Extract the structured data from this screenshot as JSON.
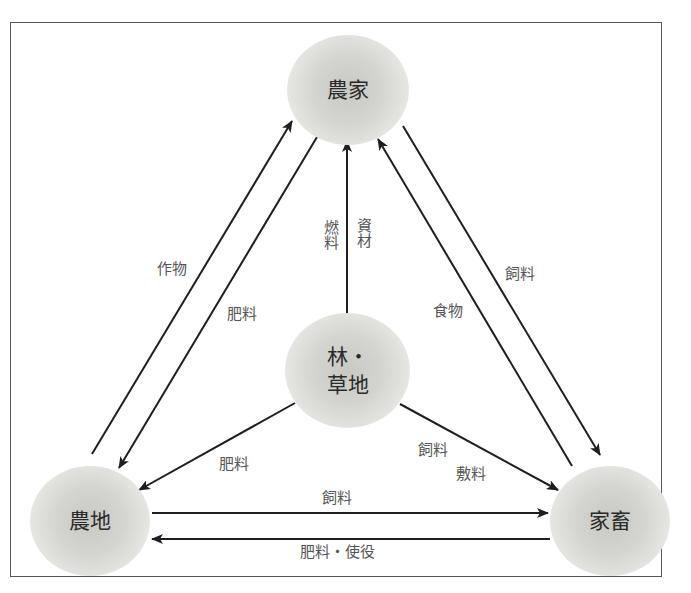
{
  "diagram": {
    "title": "",
    "nodes": {
      "farmhouse": {
        "label": "農家"
      },
      "forest": {
        "line1": "林・",
        "line2": "草地"
      },
      "farmland": {
        "label": "農地"
      },
      "livestock": {
        "label": "家畜"
      }
    },
    "edges": {
      "farmland_to_farmhouse": {
        "from": "農地",
        "to": "農家",
        "label": "作物"
      },
      "farmhouse_to_farmland": {
        "from": "農家",
        "to": "農地",
        "label": "肥料"
      },
      "forest_to_farmhouse": {
        "from": "林・草地",
        "to": "農家",
        "label_left": "燃料",
        "label_right": "資材"
      },
      "farmhouse_to_livestock": {
        "from": "農家",
        "to": "家畜",
        "label": "飼料"
      },
      "livestock_to_farmhouse": {
        "from": "家畜",
        "to": "農家",
        "label": "食物"
      },
      "forest_to_farmland": {
        "from": "林・草地",
        "to": "農地",
        "label": "肥料"
      },
      "forest_to_livestock": {
        "from": "林・草地",
        "to": "家畜",
        "label_1": "飼料",
        "label_2": "敷料"
      },
      "farmland_to_livestock": {
        "from": "農地",
        "to": "家畜",
        "label": "飼料"
      },
      "livestock_to_farmland": {
        "from": "家畜",
        "to": "農地",
        "label": "肥料・使役"
      }
    },
    "colors": {
      "line": "#1e1e1e",
      "label_text": "#555555",
      "node_text": "#2a2a2a",
      "node_fill": "#cfcfca",
      "frame": "#555555"
    }
  }
}
